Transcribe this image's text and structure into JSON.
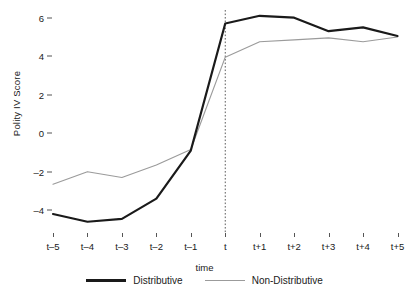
{
  "chart_data": {
    "type": "line",
    "title": "",
    "xlabel": "time",
    "ylabel": "Polity IV Score",
    "categories": [
      "t-5",
      "t-4",
      "t-3",
      "t-2",
      "t-1",
      "t",
      "t+1",
      "t+2",
      "t+3",
      "t+4",
      "t+5"
    ],
    "xtick_labels": [
      "t–5",
      "t–4",
      "t–3",
      "t–2",
      "t–1",
      "t",
      "t+1",
      "t+2",
      "t+3",
      "t+4",
      "t+5"
    ],
    "ytick_labels": [
      "6",
      "4",
      "2",
      "0",
      "–2",
      "–4"
    ],
    "ytick_values": [
      6,
      4,
      2,
      0,
      -2,
      -4
    ],
    "ylim": [
      -5.2,
      6.6
    ],
    "xlim": [
      0,
      10
    ],
    "grid": false,
    "legend_position": "bottom-center",
    "annotations": [
      {
        "type": "vertical-dotted-line",
        "at": "t",
        "label": ""
      }
    ],
    "series": [
      {
        "name": "Distributive",
        "color": "#1a1a1a",
        "style": "thick-solid",
        "values": [
          -4.2,
          -4.6,
          -4.45,
          -3.4,
          -0.9,
          5.7,
          6.1,
          6.0,
          5.3,
          5.5,
          5.05
        ]
      },
      {
        "name": "Non-Distributive",
        "color": "#9b9b9b",
        "style": "thin-solid",
        "values": [
          -2.65,
          -2.0,
          -2.3,
          -1.65,
          -0.85,
          3.95,
          4.75,
          4.85,
          4.95,
          4.75,
          5.0
        ]
      }
    ]
  },
  "legend": {
    "entries": [
      {
        "label": "Distributive"
      },
      {
        "label": "Non-Distributive"
      }
    ]
  }
}
